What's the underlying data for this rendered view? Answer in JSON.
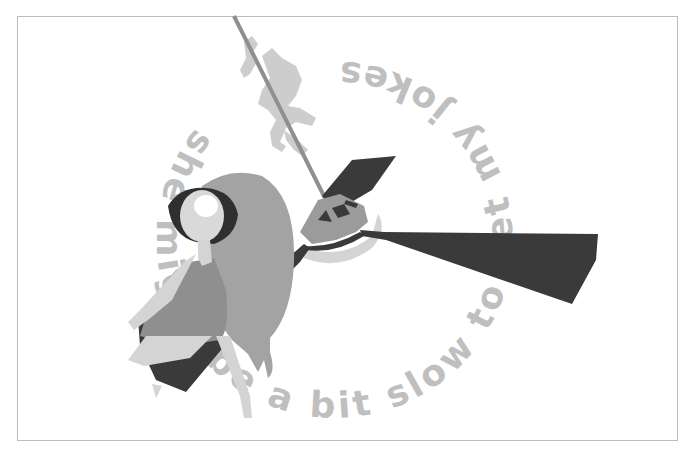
{
  "illustration": {
    "caption_arc_text": "she might be a bit slow to get my jokes",
    "visible_fragments": [
      "she",
      "mig",
      "e",
      "bit",
      "slow",
      "to",
      "g",
      "my",
      "jokes"
    ],
    "subjects": [
      "girl-with-long-hair",
      "helicopter-rotor",
      "small-figure-climbing-rope"
    ]
  },
  "colors": {
    "background": "#ffffff",
    "frame_border": "#bcbcbc",
    "text": "#bfbfbf",
    "dark": "#3a3a3a",
    "mid_gray": "#9b9b9b",
    "hair_gray": "#a3a3a3",
    "light_gray": "#cfcfcf",
    "skin": "#d9d9d9",
    "rope": "#8f8f8f"
  }
}
